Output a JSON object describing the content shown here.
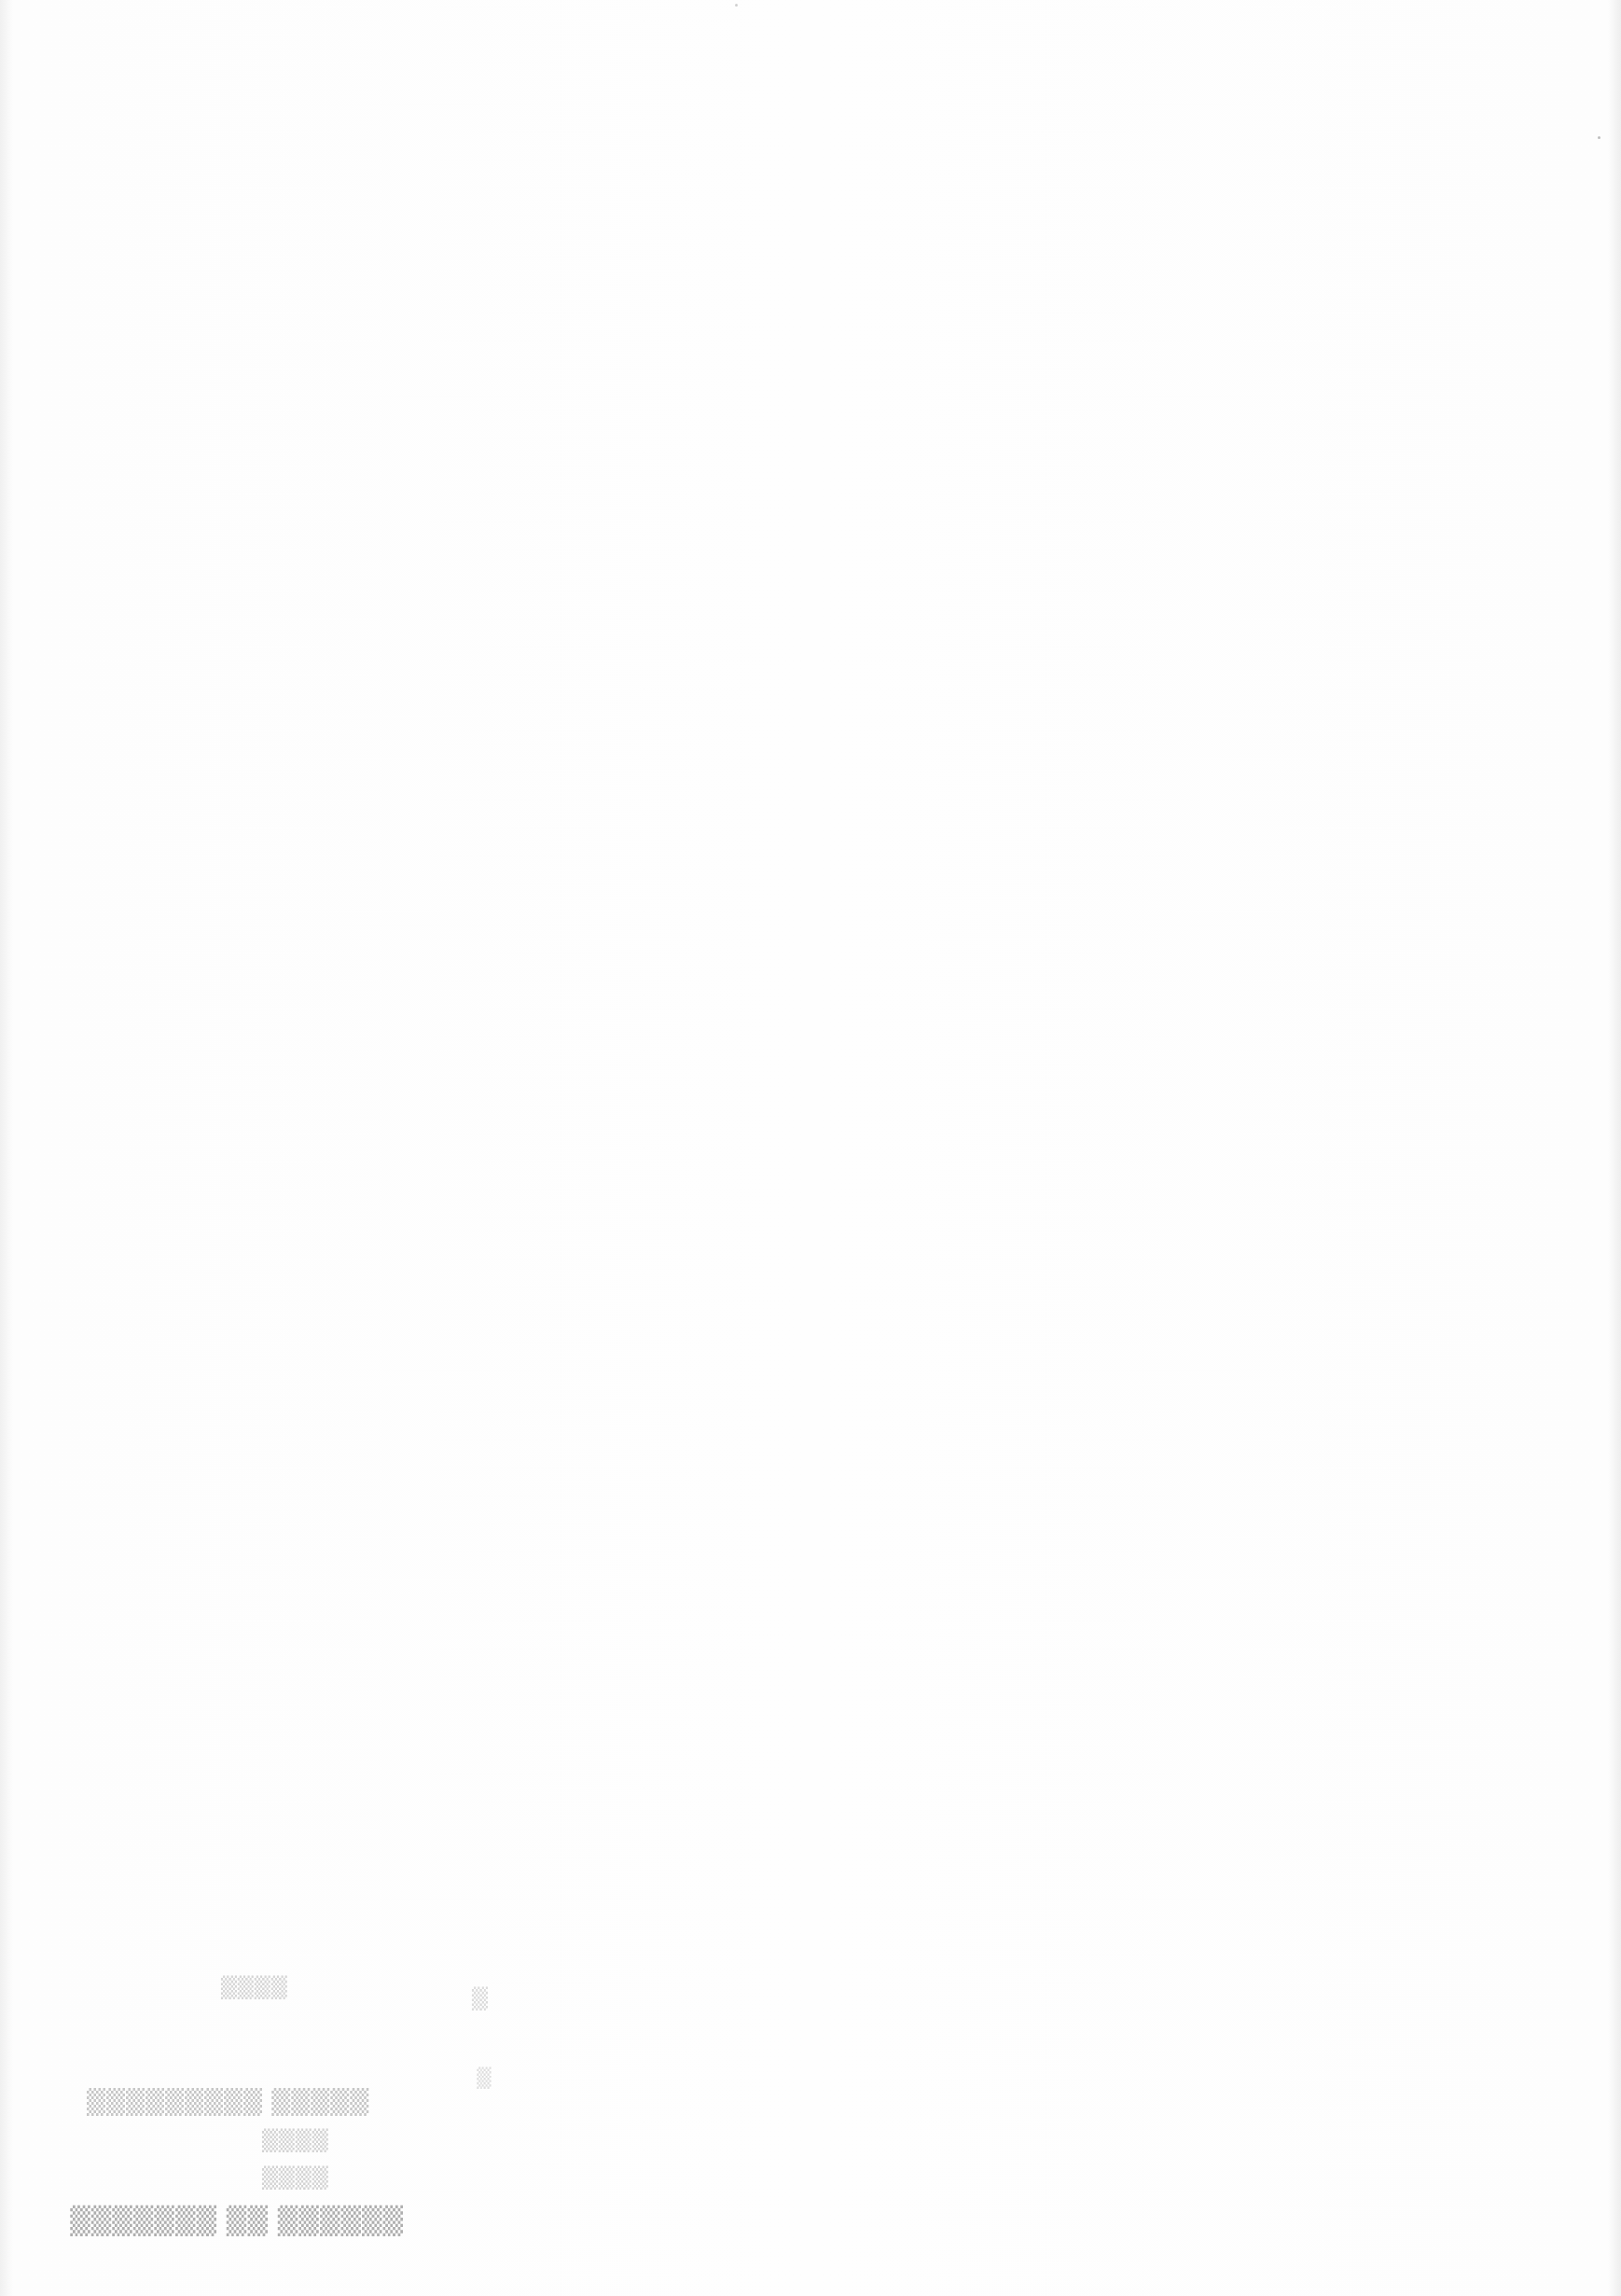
{
  "document": {
    "type": "scanned blank page",
    "background_color": "#fdfdfd",
    "visible_text": [],
    "bleed_through": {
      "description": "mirrored, illegible show-through text from reverse side, lower-left",
      "lines": [
        "▒▒▒▒",
        "▒▒▒▒▒  ▒▒▒▒▒▒▒▒▒",
        "▒▒▒▒",
        "▒▒▒▒",
        "▒▒▒▒▒▒  ▒▒  ▒▒▒▒▒▒▒"
      ],
      "side_marks": [
        "▒",
        "▒"
      ]
    }
  }
}
